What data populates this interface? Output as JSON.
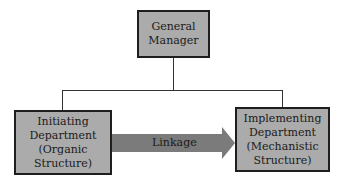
{
  "diagram": {
    "type": "org-chart",
    "nodes": [
      {
        "id": "gm",
        "lines": [
          "General",
          "Manager"
        ]
      },
      {
        "id": "initiating",
        "lines": [
          "Initiating",
          "Department",
          "(Organic",
          "Structure)"
        ]
      },
      {
        "id": "implementing",
        "lines": [
          "Implementing",
          "Department",
          "(Mechanistic",
          "Structure)"
        ]
      }
    ],
    "edges": [
      {
        "from": "gm",
        "to": "initiating",
        "style": "line"
      },
      {
        "from": "gm",
        "to": "implementing",
        "style": "line"
      },
      {
        "from": "initiating",
        "to": "implementing",
        "style": "arrow",
        "label": "Linkage"
      }
    ],
    "colors": {
      "box_fill": "#ababab",
      "box_border": "#1e1e1e",
      "arrow_fill": "#7b7b7b",
      "line": "#333333"
    }
  }
}
